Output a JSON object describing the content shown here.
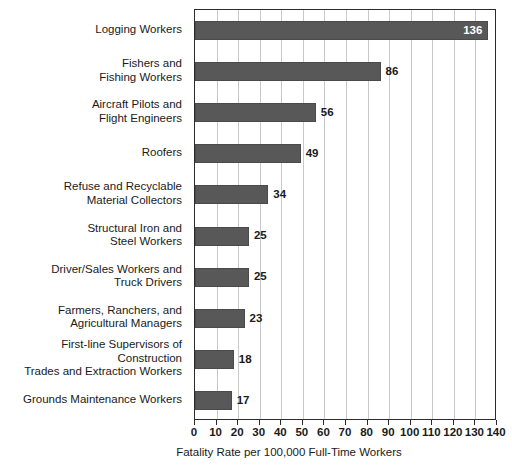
{
  "chart_data": {
    "type": "bar",
    "orientation": "horizontal",
    "title": "",
    "xlabel": "Fatality Rate per 100,000 Full-Time Workers",
    "ylabel": "",
    "xlim": [
      0,
      140
    ],
    "xticks": [
      0,
      10,
      20,
      30,
      40,
      50,
      60,
      70,
      80,
      90,
      100,
      110,
      120,
      130,
      140
    ],
    "xtick_labels": [
      "0",
      "10",
      "20",
      "30",
      "40",
      "50",
      "60",
      "70",
      "80",
      "90",
      "100",
      "110",
      "120",
      "130",
      "140"
    ],
    "grid": "vertical",
    "legend": "none",
    "categories": [
      "Logging Workers",
      "Fishers and\nFishing Workers",
      "Aircraft Pilots and\nFlight Engineers",
      "Roofers",
      "Refuse and Recyclable\nMaterial Collectors",
      "Structural Iron and\nSteel Workers",
      "Driver/Sales Workers and\nTruck Drivers",
      "Farmers, Ranchers, and\nAgricultural Managers",
      "First-line Supervisors of Construction\nTrades and Extraction Workers",
      "Grounds Maintenance Workers"
    ],
    "values": [
      136,
      86,
      56,
      49,
      34,
      25,
      25,
      23,
      18,
      17
    ],
    "value_labels": [
      "136",
      "86",
      "56",
      "49",
      "34",
      "25",
      "25",
      "23",
      "18",
      "17"
    ],
    "value_label_placement": [
      "inside",
      "outside",
      "outside",
      "outside",
      "outside",
      "outside",
      "outside",
      "outside",
      "outside",
      "outside"
    ],
    "bar_color": "#585858",
    "inside_label_color": "#ffffff",
    "outside_label_color": "#1a1a1a",
    "grid_color": "#c9c9c9",
    "axis_color": "#2b2b2b",
    "background_color": "#ffffff"
  }
}
